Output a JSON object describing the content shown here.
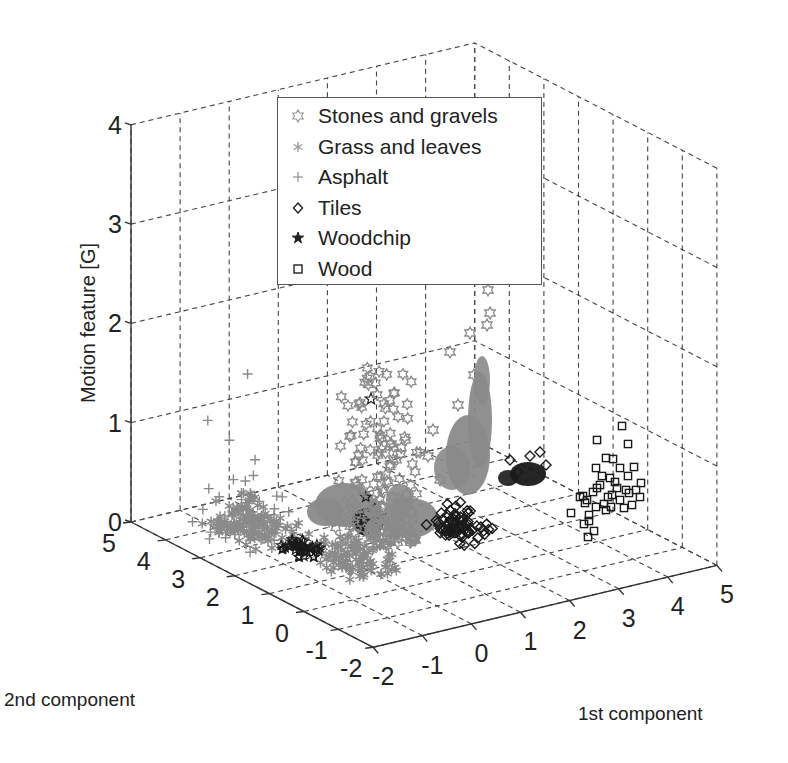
{
  "chart_data": {
    "type": "scatter3d",
    "title": "",
    "xlabel": "1st component",
    "ylabel": "2nd component",
    "zlabel": "Motion feature [G]",
    "xlim": [
      -2,
      5
    ],
    "ylim": [
      -2,
      5
    ],
    "zlim": [
      0,
      4
    ],
    "xticks": [
      "-2",
      "-1",
      "0",
      "1",
      "2",
      "3",
      "4",
      "5"
    ],
    "yticks": [
      "-2",
      "-1",
      "0",
      "1",
      "2",
      "3",
      "4",
      "5"
    ],
    "zticks": [
      "0",
      "1",
      "2",
      "3",
      "4"
    ],
    "grid": true,
    "legend_position": "upper center (inside)",
    "series": [
      {
        "name": "Stones and gravels",
        "marker": "hexagram",
        "color": "#8a8a8a",
        "clusters": [
          {
            "x_range": [
              0.5,
              1.6
            ],
            "y_range": [
              1.5,
              3.0
            ],
            "z_range": [
              0.2,
              2.4
            ],
            "density": "dense column"
          }
        ]
      },
      {
        "name": "Grass and leaves",
        "marker": "asterisk",
        "color": "#8c8c8c",
        "clusters": [
          {
            "x_range": [
              -1.2,
              -0.2
            ],
            "y_range": [
              2.5,
              4.0
            ],
            "z_range": [
              0.0,
              0.6
            ]
          },
          {
            "x_range": [
              -0.6,
              0.4
            ],
            "y_range": [
              0.5,
              1.8
            ],
            "z_range": [
              0.0,
              0.6
            ]
          }
        ]
      },
      {
        "name": "Asphalt",
        "marker": "plus",
        "color": "#8a8a8a",
        "clusters": [
          {
            "x_range": [
              -1.5,
              0.0
            ],
            "y_range": [
              2.5,
              4.3
            ],
            "z_range": [
              0.0,
              1.5
            ]
          }
        ]
      },
      {
        "name": "Tiles",
        "marker": "diamond",
        "color": "#1a1a1a",
        "clusters": [
          {
            "x_range": [
              1.8,
              2.5
            ],
            "y_range": [
              1.0,
              2.2
            ],
            "z_range": [
              0.0,
              0.6
            ]
          }
        ]
      },
      {
        "name": "Woodchip",
        "marker": "pentagram",
        "color": "#1a1a1a",
        "clusters": [
          {
            "x_range": [
              -0.8,
              -0.2
            ],
            "y_range": [
              1.8,
              2.8
            ],
            "z_range": [
              0.0,
              0.3
            ]
          }
        ],
        "outliers": [
          {
            "x": -0.6,
            "y": 4.0,
            "z": 1.2
          }
        ]
      },
      {
        "name": "Wood",
        "marker": "square",
        "color": "#222222",
        "clusters": [
          {
            "x_range": [
              3.0,
              4.3
            ],
            "y_range": [
              -0.5,
              1.5
            ],
            "z_range": [
              0.0,
              1.0
            ]
          }
        ]
      }
    ]
  },
  "legend": {
    "items": [
      {
        "label": "Stones and gravels",
        "marker": "hexagram-icon"
      },
      {
        "label": "Grass and leaves",
        "marker": "asterisk-icon"
      },
      {
        "label": "Asphalt",
        "marker": "plus-icon"
      },
      {
        "label": "Tiles",
        "marker": "diamond-icon"
      },
      {
        "label": "Woodchip",
        "marker": "pentagram-icon"
      },
      {
        "label": "Wood",
        "marker": "square-icon"
      }
    ]
  },
  "axes": {
    "x_title": "1st component",
    "y_title": "2nd component",
    "z_title": "Motion feature [G]"
  },
  "colors": {
    "gray_series": "#8a8a8a",
    "dark_series": "#1a1a1a",
    "grid": "#444444",
    "axis": "#333333"
  }
}
